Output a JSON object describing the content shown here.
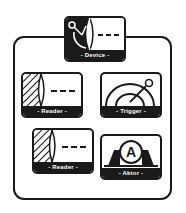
{
  "diagram": {
    "colors": {
      "stroke": "#1a1a1a",
      "background": "#ffffff"
    },
    "container": {
      "label": ""
    },
    "nodes": [
      {
        "id": "device",
        "label": "- Device -",
        "icon": "device-lens-icon"
      },
      {
        "id": "reader1",
        "label": "- Reader -",
        "icon": "reader-lens-icon"
      },
      {
        "id": "trigger",
        "label": "- Trigger -",
        "icon": "trigger-lever-icon"
      },
      {
        "id": "reader2",
        "label": "- Reader -",
        "icon": "reader-lens-icon"
      },
      {
        "id": "aktor",
        "label": "- Aktor -",
        "icon": "aktor-a-icon"
      }
    ]
  }
}
